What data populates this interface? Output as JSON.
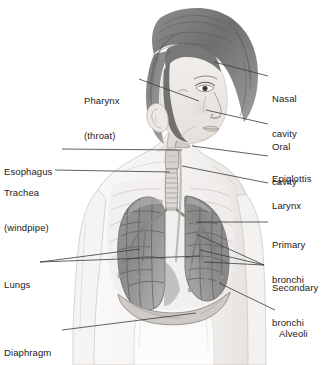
{
  "figure": {
    "style": "grayscale pencil illustration",
    "background_color": "#ffffff",
    "label_color": "#1a1a1a",
    "leader_line_color": "#3a3a3a"
  },
  "labels": {
    "pharynx": {
      "line1": "Pharynx",
      "line2": "(throat)"
    },
    "esophagus": {
      "line1": "Esophagus"
    },
    "trachea": {
      "line1": "Trachea",
      "line2": "(windpipe)"
    },
    "lungs": {
      "line1": "Lungs"
    },
    "diaphragm": {
      "line1": "Diaphragm"
    },
    "nasal_cavity": {
      "line1": "Nasal",
      "line2": "cavity"
    },
    "oral_cavity": {
      "line1": "Oral",
      "line2": "cavity"
    },
    "epiglottis": {
      "line1": "Epiglottis"
    },
    "larynx": {
      "line1": "Larynx"
    },
    "primary_bronchi": {
      "line1": "Primary",
      "line2": "bronchi"
    },
    "secondary_bronchi": {
      "line1": "Secondary",
      "line2": "bronchi"
    },
    "alveoli": {
      "line1": "Alveoli"
    }
  }
}
